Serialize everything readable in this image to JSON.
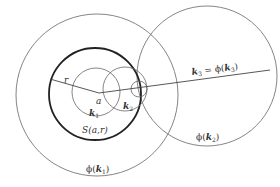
{
  "diagram": {
    "stroke_color": "#555555",
    "thick_stroke_color": "#222222",
    "labels": {
      "r": "r",
      "a": "a",
      "k1": "k",
      "k1_sub": "1",
      "k2": "k",
      "k2_sub": "2",
      "S": "S(a,r)",
      "k3_eq": "k",
      "k3_sub": "3",
      "k3_rhs": " = ϕ(",
      "k3_rhs_k": "k",
      "k3_rhs_sub": "3",
      "k3_close": ")",
      "phi_k2": "ϕ(",
      "phi_k2_k": "k",
      "phi_k2_sub": "2",
      "phi_k2_close": ")",
      "phi_k1": "ϕ(",
      "phi_k1_k": "k",
      "phi_k1_sub": "1",
      "phi_k1_close": ")"
    },
    "circles": [
      {
        "name": "phi-k1",
        "cx": 97,
        "cy": 95,
        "r": 81
      },
      {
        "name": "S-a-r",
        "cx": 95,
        "cy": 94,
        "r": 46
      },
      {
        "name": "k1",
        "cx": 96,
        "cy": 92,
        "r": 24
      },
      {
        "name": "k2",
        "cx": 125,
        "cy": 89,
        "r": 22
      },
      {
        "name": "k3",
        "cx": 139,
        "cy": 89,
        "r": 8
      },
      {
        "name": "phi-k2",
        "cx": 207,
        "cy": 76,
        "r": 70
      }
    ]
  }
}
